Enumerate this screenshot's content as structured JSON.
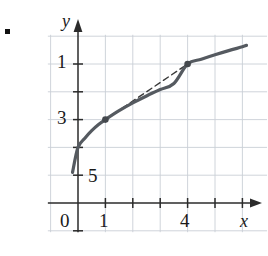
{
  "figure": {
    "kind": "cartesian-plot",
    "bullet_marker": "■",
    "axes": {
      "x_axis_name": "x",
      "y_axis_name": "y",
      "x_tick_labels": [
        "0",
        "1",
        "4"
      ],
      "y_tick_labels": [
        "5",
        "3",
        "1"
      ],
      "origin_label": "0"
    },
    "colors": {
      "grid": "#c9cfd6",
      "axis": "#2b2b2b",
      "curve": "#555a60",
      "secant": "#3a3a3a",
      "point": "#44484d",
      "text": "#1a1a1a"
    }
  },
  "chart_data": {
    "type": "line",
    "title": "",
    "xlabel": "x",
    "ylabel": "y",
    "xlim": [
      -1.1,
      6.9
    ],
    "ylim": [
      -1.05,
      6.05
    ],
    "grid": true,
    "legend": null,
    "xticks": [
      0,
      1,
      4
    ],
    "xticklabels": [
      "0",
      "1",
      "4"
    ],
    "yticks": [
      1,
      3,
      5
    ],
    "yticklabels": [
      "1",
      "3",
      "5"
    ],
    "x_minor_ticks": [
      2,
      3,
      5,
      6
    ],
    "y_minor_ticks": [
      2,
      4
    ],
    "series": [
      {
        "name": "curve",
        "style": "solid",
        "x": [
          -0.2,
          0.0,
          0.25,
          0.5,
          0.75,
          1.0,
          1.5,
          2.0,
          2.5,
          3.0,
          3.5,
          4.0,
          4.5,
          5.0,
          5.5,
          6.0,
          6.15
        ],
        "y": [
          1.1,
          2.0,
          2.33,
          2.6,
          2.82,
          3.0,
          3.32,
          3.6,
          3.85,
          4.08,
          4.3,
          5.0,
          5.17,
          5.33,
          5.48,
          5.62,
          5.67
        ]
      },
      {
        "name": "secant",
        "style": "dashed",
        "x": [
          1.0,
          4.0
        ],
        "y": [
          3.0,
          5.0
        ]
      }
    ],
    "points": [
      {
        "name": "point-a",
        "x": 1,
        "y": 3,
        "label": ""
      },
      {
        "name": "point-b",
        "x": 4,
        "y": 5,
        "label": ""
      }
    ]
  }
}
